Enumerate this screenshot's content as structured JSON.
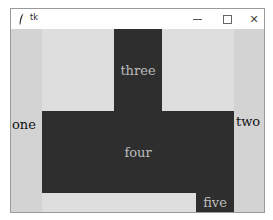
{
  "window": {
    "title": "tk",
    "icon": "feather-icon",
    "controls": {
      "minimize": "minimize-icon",
      "maximize": "maximize-icon",
      "close": "close-icon",
      "close_glyph": "✕"
    }
  },
  "labels": {
    "one": "one",
    "two": "two",
    "three": "three",
    "four": "four",
    "five": "five"
  },
  "colors": {
    "client_bg": "#dedede",
    "side_column_bg": "#d3d3d3",
    "dark_block_bg": "#2e2e2e",
    "dark_block_text": "#bdbdbd",
    "side_text": "#111111"
  }
}
